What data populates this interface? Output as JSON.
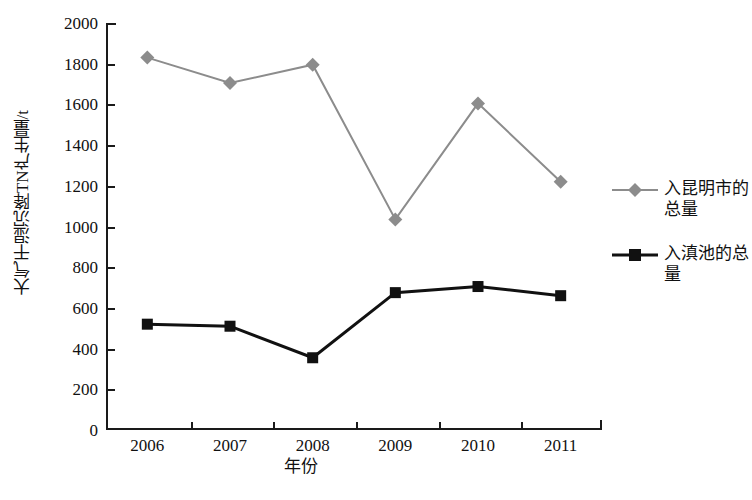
{
  "chart_data": {
    "type": "line",
    "title": "",
    "xlabel": "年份",
    "ylabel": "大气干湿沉降TN产生量/t",
    "categories": [
      "2006",
      "2007",
      "2008",
      "2009",
      "2010",
      "2011"
    ],
    "x": [
      2006,
      2007,
      2008,
      2009,
      2010,
      2011
    ],
    "ylim": [
      0,
      2000
    ],
    "yticks": [
      0,
      200,
      400,
      600,
      800,
      1000,
      1200,
      1400,
      1600,
      1800,
      2000
    ],
    "ytick_labels": [
      "0",
      "200",
      "400",
      "600",
      "800",
      "1000",
      "1200",
      "1400",
      "1600",
      "1800",
      "2000"
    ],
    "grid": false,
    "legend_position": "right",
    "series": [
      {
        "name": "入昆明市的总量",
        "color": "#8c8c8c",
        "marker": "diamond",
        "values": [
          1830,
          1705,
          1795,
          1035,
          1605,
          1220
        ]
      },
      {
        "name": "入滇池的总量",
        "color": "#111111",
        "marker": "square",
        "values": [
          520,
          510,
          355,
          675,
          705,
          660
        ]
      }
    ]
  },
  "axes": {
    "y_title": "大气干湿沉降TN产生量/t",
    "x_title": "年份"
  },
  "legend": {
    "entries": [
      {
        "label": "入昆明市的总量",
        "color": "#8c8c8c",
        "marker": "diamond-icon"
      },
      {
        "label": "入滇池的总量",
        "color": "#111111",
        "marker": "square-icon"
      }
    ]
  }
}
